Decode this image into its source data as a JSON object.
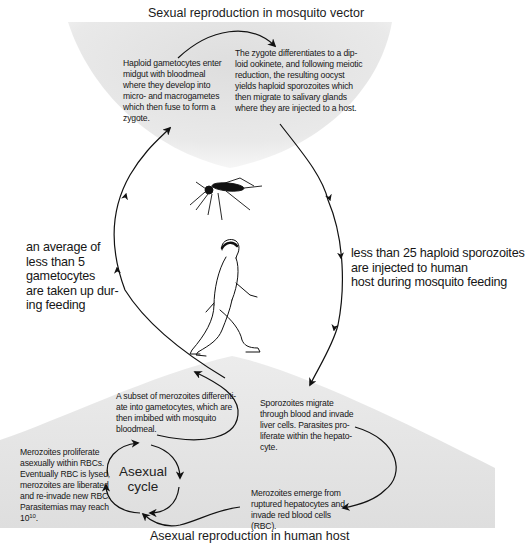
{
  "diagram": {
    "top_title": "Sexual reproduction in mosquito vector",
    "bottom_title": "Asexual reproduction in human host",
    "mosquito_stage": {
      "left_text": [
        "Haploid gametocytes enter",
        "midgut with bloodmeal",
        "where they develop into",
        "micro- and macrogametes",
        "which then fuse to form a",
        "zygote."
      ],
      "right_text": [
        "The zygote differentiates to a dip-",
        "loid ookinete, and following meiotic",
        "reduction, the resulting oocyst",
        "yields haploid sporozoites which",
        "then migrate to salivary glands",
        "where they are injected to a host."
      ]
    },
    "left_annotation": [
      "an average of",
      "less than 5",
      "gametocytes",
      "are taken up dur-",
      "ing feeding"
    ],
    "right_annotation": [
      "less than 25 haploid sporozoites",
      "are injected to human",
      "host during mosquito feeding"
    ],
    "human_stage": {
      "gametocyte_text": [
        "A subset of merozoites differenti-",
        "ate into gametocytes, which are",
        "then imbibed with mosquito",
        "bloodmeal."
      ],
      "liver_text": [
        "Sporozoites migrate",
        "through blood and invade",
        "liver cells.  Parasites pro-",
        "liferate within the hepato-",
        "cyte."
      ],
      "rbc_text": [
        "Merozoites proliferate",
        "asexually within RBCs.",
        "Eventually RBC is lysed,",
        "merozoites are liberated",
        "and re-invade new RBC.",
        "Parasitemias may reach"
      ],
      "rbc_text_last_base": "10",
      "rbc_text_last_exp": "10",
      "rbc_text_last_tail": ".",
      "emerge_text": [
        "Merozoites emerge from",
        "ruptured hepatocytes and",
        "invade red blood cells",
        "(RBC)."
      ],
      "cycle_label": [
        "Asexual",
        "cycle"
      ]
    },
    "illustrations": [
      "mosquito-icon",
      "walking-human-icon"
    ],
    "colors": {
      "shade": "#e6e6e6",
      "ink": "#111111",
      "background": "#ffffff"
    }
  }
}
